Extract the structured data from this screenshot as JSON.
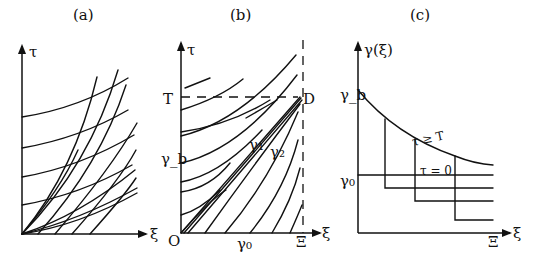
{
  "figure": {
    "panels": [
      {
        "id": "a",
        "title": "(a)",
        "y_axis_label": "τ",
        "x_axis_label": "ξ",
        "description": "Two families of crossing characteristic curves: nearly horizontal rising curves and steep curves fanning from the origin"
      },
      {
        "id": "b",
        "title": "(b)",
        "y_axis_label": "τ",
        "x_axis_label": "ξ",
        "origin_label": "O",
        "x_tick_labels": {
          "gamma0": "γ₀",
          "xi_max": "Ξ"
        },
        "y_tick_labels": {
          "T": "T",
          "gamma_b": "γ_b"
        },
        "point_labels": {
          "D": "D",
          "gamma1": "γ₁",
          "gamma2": "γ₂"
        },
        "description": "Characteristic curves bounded by dashed line τ = T and dashed line ξ = Ξ; curves γ₁ and γ₂ converge at point D"
      },
      {
        "id": "c",
        "title": "(c)",
        "y_axis_label": "γ(ξ)",
        "x_axis_label": "ξ",
        "x_tick_labels": {
          "xi_max": "Ξ"
        },
        "y_tick_labels": {
          "gamma_b": "γ_b",
          "gamma0": "γ₀"
        },
        "curve_labels": {
          "upper": "τ ≥ T",
          "lower": "τ = 0"
        },
        "description": "Decreasing profile from γ_b for τ ≥ T, horizontal profile γ₀ at τ = 0, and intermediate step profiles"
      }
    ]
  }
}
